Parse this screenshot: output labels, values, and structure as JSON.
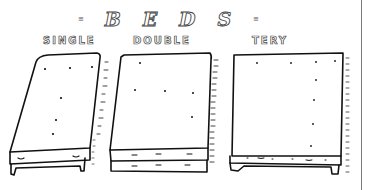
{
  "title": {
    "letters": [
      "B",
      "E",
      "D",
      "S"
    ],
    "deco_left": "≡",
    "deco_right": "≡"
  },
  "beds": [
    {
      "label": "SINGLE",
      "type": "single"
    },
    {
      "label": "DOUBLE",
      "type": "double"
    },
    {
      "label": "TERY",
      "type": "tery"
    }
  ],
  "colors": {
    "ink": "#111111",
    "background": "#ffffff",
    "divider": "#7a7a7a"
  }
}
